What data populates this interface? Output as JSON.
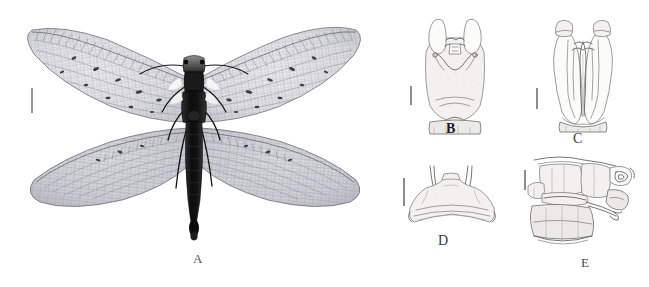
{
  "figure": {
    "type": "scientific-illustration-plate",
    "background_color": "#ffffff",
    "width": 649,
    "height": 287,
    "panel_count": 5
  },
  "panels": [
    {
      "id": "A",
      "label": "A",
      "label_x": 196,
      "label_y": 252,
      "subject": "adult-habitus-dorsal",
      "medium": "photograph-grayscale",
      "has_scale_bar": true,
      "scale_bar": {
        "x": 31,
        "y": 88,
        "length": 25,
        "orientation": "vertical"
      }
    },
    {
      "id": "B",
      "label": "B",
      "label_x": 446,
      "label_y": 122,
      "subject": "male-genitalia-dorsal",
      "medium": "line-drawing",
      "has_scale_bar": true,
      "scale_bar": {
        "x": 410,
        "y": 86,
        "length": 19,
        "orientation": "vertical"
      }
    },
    {
      "id": "C",
      "label": "C",
      "label_x": 573,
      "label_y": 132,
      "subject": "male-genitalia-ventral",
      "medium": "line-drawing",
      "has_scale_bar": true,
      "scale_bar": {
        "x": 536,
        "y": 88,
        "length": 21,
        "orientation": "vertical"
      }
    },
    {
      "id": "D",
      "label": "D",
      "label_x": 438,
      "label_y": 234,
      "subject": "ninth-sternite-ventral",
      "medium": "line-drawing",
      "has_scale_bar": true,
      "scale_bar": {
        "x": 403,
        "y": 178,
        "length": 28,
        "orientation": "vertical"
      }
    },
    {
      "id": "E",
      "label": "E",
      "label_x": 581,
      "label_y": 256,
      "subject": "male-terminalia-lateral",
      "medium": "line-drawing",
      "has_scale_bar": true,
      "scale_bar": {
        "x": 524,
        "y": 170,
        "length": 20,
        "orientation": "vertical"
      }
    }
  ],
  "colors": {
    "background": "#ffffff",
    "line": "#7b7b7b",
    "line_dark": "#5f5f5f",
    "body_dark": "#141414",
    "wing_membrane": "#d8d8dc",
    "scale_bar": "#8d8d8d",
    "label_text": "#2a2a2a"
  }
}
